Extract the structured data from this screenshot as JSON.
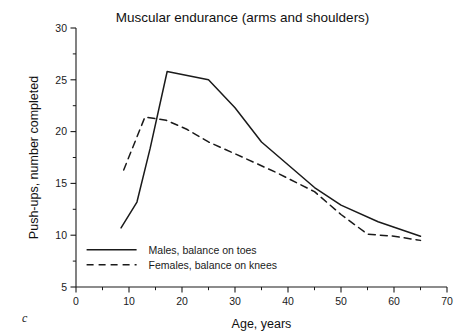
{
  "panel": {
    "label": "c"
  },
  "chart_data": {
    "type": "line",
    "title": "Muscular endurance (arms and shoulders)",
    "xlabel": "Age, years",
    "ylabel": "Push-ups, number completed",
    "xlim": [
      0,
      70
    ],
    "ylim": [
      5,
      30
    ],
    "xticks": [
      0,
      10,
      20,
      30,
      40,
      50,
      60,
      70
    ],
    "xtick_labels": [
      "0",
      "10",
      "20",
      "30",
      "40",
      "50",
      "60",
      "70"
    ],
    "xminor_step": 5,
    "yticks": [
      5,
      10,
      15,
      20,
      25,
      30
    ],
    "ytick_labels": [
      "5",
      "10",
      "15",
      "20",
      "25",
      "30"
    ],
    "yminor_step": 2.5,
    "grid": false,
    "legend_position": "lower-left-inside",
    "series": [
      {
        "name": "Males, balance on toes",
        "style": "solid",
        "color": "#1a1a1a",
        "x": [
          8.5,
          11.5,
          14.0,
          17.2,
          25.0,
          30.0,
          35.0,
          40.0,
          45.0,
          50.0,
          57.0,
          61.0,
          65.0
        ],
        "y": [
          10.7,
          13.2,
          18.4,
          25.8,
          25.0,
          22.3,
          19.0,
          16.8,
          14.6,
          12.9,
          11.3,
          10.6,
          9.9
        ]
      },
      {
        "name": "Females, balance on knees",
        "style": "dashed",
        "color": "#1a1a1a",
        "x": [
          9.0,
          13.0,
          17.0,
          21.0,
          25.0,
          32.0,
          38.0,
          45.0,
          50.0,
          55.0,
          60.0,
          65.0
        ],
        "y": [
          16.3,
          21.4,
          21.1,
          20.2,
          19.0,
          17.4,
          16.0,
          14.2,
          12.0,
          10.1,
          9.9,
          9.5
        ]
      }
    ]
  }
}
